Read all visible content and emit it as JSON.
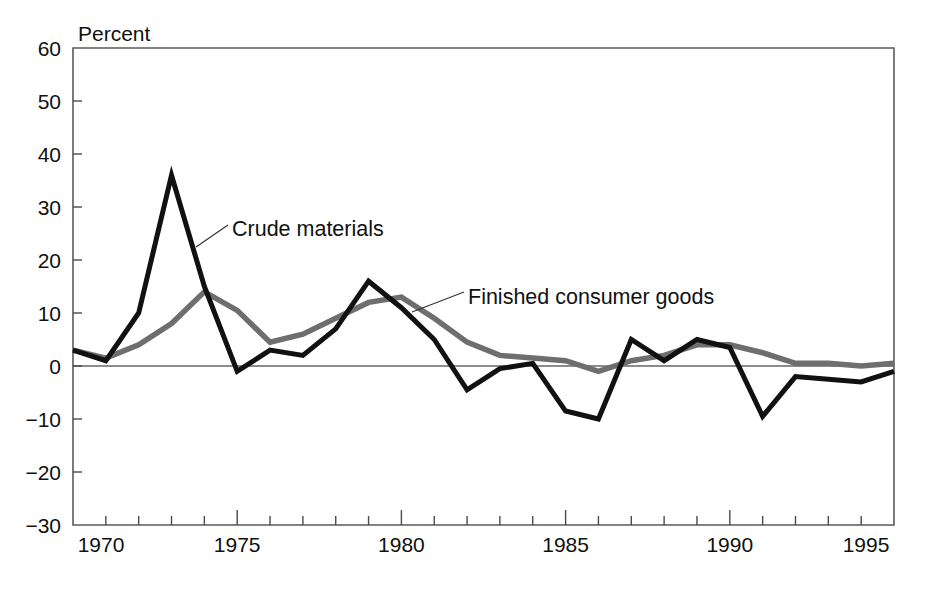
{
  "figure": {
    "background_color": "#ffffff",
    "plot_frame": {
      "left": 73,
      "top": 48,
      "right": 894,
      "bottom": 525
    }
  },
  "chart_data": {
    "type": "line",
    "title": "",
    "subtitle": "",
    "xlabel": "",
    "ylabel": "Percent",
    "ylabel_position": "top-left-above-axis",
    "grid": false,
    "legend": "annotations-inline",
    "xlim": [
      1970,
      1995
    ],
    "ylim": [
      -30,
      60
    ],
    "x_tick_labels": [
      "1970",
      "1975",
      "1980",
      "1985",
      "1990",
      "1995"
    ],
    "x_tick_values": [
      1970,
      1975,
      1980,
      1985,
      1990,
      1995
    ],
    "x_minor_tick_interval": 1,
    "y_tick_labels": [
      "60",
      "50",
      "40",
      "30",
      "20",
      "10",
      "0",
      "−10",
      "−20",
      "−30"
    ],
    "y_tick_values": [
      60,
      50,
      40,
      30,
      20,
      10,
      0,
      -10,
      -20,
      -30
    ],
    "zero_line": 0,
    "x": [
      1970,
      1971,
      1972,
      1973,
      1974,
      1975,
      1976,
      1977,
      1978,
      1979,
      1980,
      1981,
      1982,
      1983,
      1984,
      1985,
      1986,
      1987,
      1988,
      1989,
      1990,
      1991,
      1992,
      1993,
      1994,
      1995
    ],
    "series": [
      {
        "name": "Crude materials",
        "color": "#111111",
        "stroke_width": 5.0,
        "values": [
          3,
          1,
          10,
          36,
          15,
          -1,
          3,
          2,
          7,
          16,
          11,
          5,
          -4.5,
          -0.5,
          0.5,
          -8.5,
          -10,
          5,
          1,
          5,
          3.5,
          -9.5,
          -2,
          -2.5,
          -3,
          -1
        ]
      },
      {
        "name": "Finished consumer goods",
        "color": "#6e6e6e",
        "stroke_width": 5.5,
        "values": [
          3,
          1.5,
          4,
          8,
          14,
          10.5,
          4.5,
          6,
          9,
          12,
          13,
          9,
          4.5,
          2,
          1.5,
          1,
          -1,
          1,
          2,
          4,
          4,
          2.5,
          0.5,
          0.5,
          0,
          0.5
        ]
      }
    ],
    "annotations": [
      {
        "label": "Crude materials",
        "text_x": 232,
        "text_y": 236,
        "leader": [
          [
            196,
            247
          ],
          [
            228,
            225
          ]
        ],
        "target_series": "Crude materials"
      },
      {
        "label": "Finished consumer goods",
        "text_x": 468,
        "text_y": 304,
        "leader": [
          [
            412,
            312
          ],
          [
            464,
            292
          ]
        ],
        "target_series": "Finished consumer goods"
      }
    ]
  }
}
